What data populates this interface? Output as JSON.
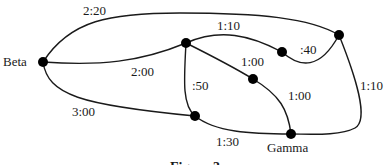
{
  "diagram": {
    "type": "weighted-graph",
    "nodes": [
      {
        "id": "beta",
        "label": "Beta",
        "x": 43,
        "y": 62
      },
      {
        "id": "n_top_mid",
        "label": "",
        "x": 186,
        "y": 43
      },
      {
        "id": "n_top_right",
        "label": "",
        "x": 339,
        "y": 35
      },
      {
        "id": "n_mid_right",
        "label": "",
        "x": 282,
        "y": 52
      },
      {
        "id": "n_center",
        "label": "",
        "x": 253,
        "y": 79
      },
      {
        "id": "n_bottom_left",
        "label": "",
        "x": 195,
        "y": 116
      },
      {
        "id": "gamma",
        "label": "Gamma",
        "x": 291,
        "y": 134
      }
    ],
    "edges": [
      {
        "from": "beta",
        "to": "n_top_right",
        "weight": "2:20"
      },
      {
        "from": "beta",
        "to": "n_top_mid",
        "weight": "2:00"
      },
      {
        "from": "beta",
        "to": "n_bottom_left",
        "weight": "3:00"
      },
      {
        "from": "n_top_mid",
        "to": "n_mid_right",
        "weight": "1:10"
      },
      {
        "from": "n_mid_right",
        "to": "n_top_right",
        "weight": ":40"
      },
      {
        "from": "n_top_mid",
        "to": "n_center",
        "weight": "1:00"
      },
      {
        "from": "n_center",
        "to": "gamma",
        "weight": "1:00"
      },
      {
        "from": "n_top_mid",
        "to": "n_bottom_left",
        "weight": ":50"
      },
      {
        "from": "n_bottom_left",
        "to": "gamma",
        "weight": "1:30"
      },
      {
        "from": "n_top_right",
        "to": "gamma",
        "weight": "1:10"
      }
    ],
    "labels": {
      "beta": "Beta",
      "gamma": "Gamma",
      "e_beta_topright": "2:20",
      "e_beta_topmid": "2:00",
      "e_beta_bottomleft": "3:00",
      "e_topmid_midright": "1:10",
      "e_midright_topright": ":40",
      "e_topmid_center": "1:00",
      "e_center_gamma": "1:00",
      "e_topmid_bottomleft": ":50",
      "e_bottomleft_gamma": "1:30",
      "e_topright_gamma": "1:10"
    },
    "caption": "Figure 3"
  }
}
